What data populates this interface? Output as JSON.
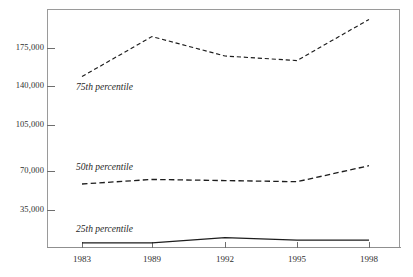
{
  "chart_data": {
    "type": "line",
    "title": "",
    "subtitle": "",
    "xlabel": "",
    "ylabel": "",
    "categories": [
      "1983",
      "1989",
      "1992",
      "1995",
      "1998"
    ],
    "x": [
      1983,
      1989,
      1992,
      1995,
      1998
    ],
    "ylim": [
      0,
      200000
    ],
    "yticks": [
      35000,
      70000,
      105000,
      140000,
      175000
    ],
    "ytick_labels": [
      "35,000",
      "70,000",
      "105,000",
      "140,000",
      "175,000"
    ],
    "grid": false,
    "legend_position": "inline-annotation",
    "series": [
      {
        "name": "75th percentile",
        "style": "dashed",
        "color": "#1d1d1d",
        "values": [
          150000,
          185000,
          168000,
          164000,
          200000
        ]
      },
      {
        "name": "50th percentile",
        "style": "dashed",
        "color": "#1d1d1d",
        "values": [
          56000,
          60000,
          59000,
          58000,
          72000
        ]
      },
      {
        "name": "25th percentile",
        "style": "solid",
        "color": "#1d1d1d",
        "values": [
          4500,
          4500,
          9000,
          7000,
          7000
        ]
      }
    ],
    "annotations": [
      {
        "text": "75th percentile",
        "series": "75th percentile"
      },
      {
        "text": "50th percentile",
        "series": "50th percentile"
      },
      {
        "text": "25th percentile",
        "series": "25th percentile"
      }
    ]
  },
  "axes": {
    "y_labels": [
      "175,000",
      "140,000",
      "105,000",
      "70,000",
      "35,000"
    ],
    "x_labels": [
      "1983",
      "1989",
      "1992",
      "1995",
      "1998"
    ]
  }
}
